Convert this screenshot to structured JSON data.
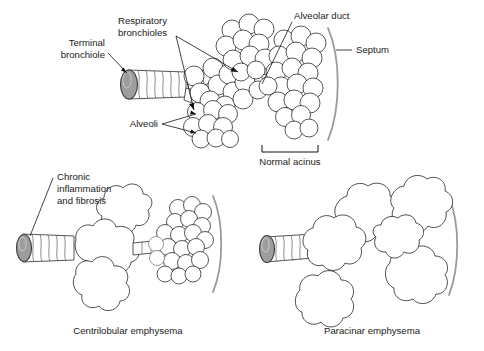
{
  "figure": {
    "background_color": "#ffffff",
    "line_color": "#1f1f1f",
    "septum_color": "#9a9a9a",
    "bronchiole_cap_color": "#9d9d9d"
  },
  "panels": [
    {
      "id": "normal",
      "caption": "",
      "labels": [
        {
          "name": "terminal-bronchiole",
          "lines": [
            "Terminal",
            "bronchiole"
          ],
          "align": "right"
        },
        {
          "name": "respiratory-bronchioles",
          "lines": [
            "Respiratory",
            "bronchioles"
          ],
          "align": "left"
        },
        {
          "name": "alveoli",
          "lines": [
            "Alveoli"
          ],
          "align": "right"
        },
        {
          "name": "alveolar-duct",
          "lines": [
            "Alveolar duct"
          ],
          "align": "left"
        },
        {
          "name": "septum",
          "lines": [
            "Septum"
          ],
          "align": "left"
        }
      ],
      "bracket_label": "Normal acinus"
    },
    {
      "id": "centrilobular",
      "caption": "Centrilobular emphysema",
      "labels": [
        {
          "name": "chronic-inflammation-and-fibrosis",
          "lines": [
            "Chronic",
            "inflammation",
            "and fibrosis"
          ],
          "align": "left"
        }
      ],
      "bracket_label": ""
    },
    {
      "id": "paracinar",
      "caption": "Paracinar emphysema",
      "labels": [],
      "bracket_label": ""
    }
  ],
  "text": {
    "terminal_bronchiole_l1": "Terminal",
    "terminal_bronchiole_l2": "bronchiole",
    "respiratory_bronchioles_l1": "Respiratory",
    "respiratory_bronchioles_l2": "bronchioles",
    "alveoli": "Alveoli",
    "alveolar_duct": "Alveolar duct",
    "septum": "Septum",
    "normal_acinus": "Normal acinus",
    "chronic_l1": "Chronic",
    "chronic_l2": "inflammation",
    "chronic_l3": "and fibrosis",
    "centrilobular_caption": "Centrilobular emphysema",
    "paracinar_caption": "Paracinar emphysema"
  }
}
